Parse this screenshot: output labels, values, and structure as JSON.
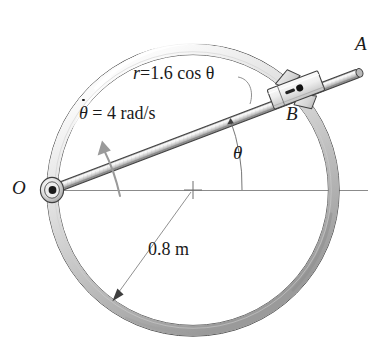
{
  "figure": {
    "background_color": "#ffffff",
    "ink_color": "#1a1a1a",
    "metal_light": "#f2f2f2",
    "metal_mid": "#c9c9c9",
    "metal_dark": "#8a8a8a"
  },
  "labels": {
    "point_a": "A",
    "point_b": "B",
    "point_o": "O",
    "angle_theta": "θ",
    "radius_dimension": "0.8 m"
  },
  "equations": {
    "path_equation_lhs": "r",
    "path_equation_rhs": "=1.6 cos θ",
    "angular_velocity_symbol": "θ",
    "angular_velocity_value": "= 4 rad/s"
  },
  "geometry": {
    "hoop_center_x": 193,
    "hoop_center_y": 190,
    "hoop_radius": 141,
    "hoop_tube_width": 11,
    "pivot_o_x": 51,
    "pivot_o_y": 190,
    "rod_tip_a_x": 361,
    "rod_tip_a_y": 73,
    "collar_b_x": 296,
    "collar_b_y": 90,
    "rod_angle_degrees": 21,
    "axis_line_start_x": 51,
    "axis_line_end_x": 368,
    "axis_line_y": 190
  }
}
